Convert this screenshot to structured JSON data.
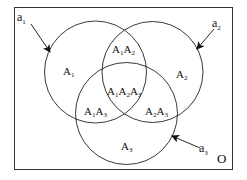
{
  "diagram": {
    "type": "venn",
    "universe_label": "O",
    "sets": [
      {
        "id": "A1",
        "label_base": "A",
        "label_sub": "1",
        "pointer_base": "a",
        "pointer_sub": "1"
      },
      {
        "id": "A2",
        "label_base": "A",
        "label_sub": "2",
        "pointer_base": "a",
        "pointer_sub": "2"
      },
      {
        "id": "A3",
        "label_base": "A",
        "label_sub": "3",
        "pointer_base": "a",
        "pointer_sub": "3"
      }
    ],
    "regions": {
      "a1_only": {
        "parts": [
          [
            "A",
            "1"
          ]
        ]
      },
      "a2_only": {
        "parts": [
          [
            "A",
            "2"
          ]
        ]
      },
      "a3_only": {
        "parts": [
          [
            "A",
            "3"
          ]
        ]
      },
      "a1a2": {
        "parts": [
          [
            "A",
            "1"
          ],
          [
            "A",
            "2"
          ]
        ]
      },
      "a1a3": {
        "parts": [
          [
            "A",
            "1"
          ],
          [
            "A",
            "3"
          ]
        ]
      },
      "a2a3": {
        "parts": [
          [
            "A",
            "2"
          ],
          [
            "A",
            "3"
          ]
        ]
      },
      "a1a2a3": {
        "parts": [
          [
            "A",
            "1"
          ],
          [
            "A",
            "2"
          ],
          [
            "A",
            "3"
          ]
        ]
      }
    },
    "colors": {
      "stroke": "#222222",
      "background": "#ffffff"
    }
  }
}
